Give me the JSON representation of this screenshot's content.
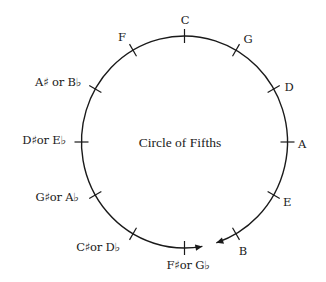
{
  "diagram": {
    "title": "Circle of Fifths",
    "title_pos": [
      180,
      143
    ],
    "colors": {
      "line": "#1a1a1a",
      "background": "#ffffff"
    },
    "circle": {
      "cx": 184.5,
      "cy": 142,
      "rx": 103,
      "ry": 106,
      "gap_start_deg": -80,
      "gap_end_deg": -72
    },
    "arrows": [
      {
        "name": "arrow-from-f-sharp",
        "tip": [
          208,
          246
        ]
      },
      {
        "name": "arrow-from-b",
        "tip": [
          214,
          244
        ]
      }
    ],
    "notes": [
      {
        "label": "C",
        "angle": 90,
        "pos": [
          185,
          21
        ]
      },
      {
        "label": "G",
        "angle": 60,
        "pos": [
          248,
          40
        ]
      },
      {
        "label": "D",
        "angle": 30,
        "pos": [
          289,
          88
        ]
      },
      {
        "label": "A",
        "angle": 0,
        "pos": [
          302,
          145
        ]
      },
      {
        "label": "E",
        "angle": -30,
        "pos": [
          287,
          203
        ]
      },
      {
        "label": "B",
        "angle": -60,
        "pos": [
          243,
          252
        ]
      },
      {
        "label": "F♯or G♭",
        "angle": -90,
        "pos": [
          188,
          266
        ]
      },
      {
        "label": "C♯or D♭",
        "angle": -120,
        "pos": [
          98,
          248
        ]
      },
      {
        "label": "G♯or A♭",
        "angle": -150,
        "pos": [
          57,
          198
        ]
      },
      {
        "label": "D♯or E♭",
        "angle": 180,
        "pos": [
          44,
          141
        ]
      },
      {
        "label": "A♯ or B♭",
        "angle": 150,
        "pos": [
          58,
          83
        ]
      },
      {
        "label": "F",
        "angle": 120,
        "pos": [
          122,
          38
        ]
      }
    ]
  }
}
